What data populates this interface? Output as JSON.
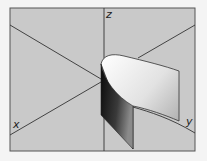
{
  "diagram": {
    "type": "3d-surface-parabolic-cylinder",
    "colors": {
      "background": "#c9c9c9",
      "frame": "#555555",
      "axis": "#333333",
      "page": "#f4f4f4"
    },
    "axes": {
      "x": {
        "label": "x"
      },
      "y": {
        "label": "y"
      },
      "z": {
        "label": "z"
      }
    }
  }
}
